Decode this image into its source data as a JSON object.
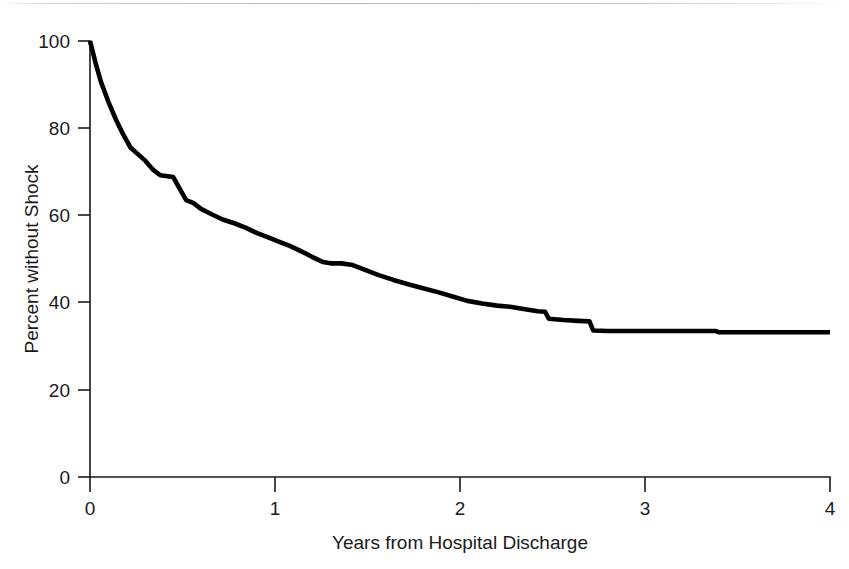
{
  "chart_data": {
    "type": "line",
    "title": "",
    "subtitle": "",
    "xlabel": "Years from Hospital Discharge",
    "ylabel": "Percent without Shock",
    "xlim": [
      0,
      4
    ],
    "ylim": [
      0,
      100
    ],
    "xticks": [
      0,
      1,
      2,
      3,
      4
    ],
    "xtick_labels": [
      "0",
      "1",
      "2",
      "3",
      "4"
    ],
    "yticks": [
      0,
      20,
      40,
      60,
      80,
      100
    ],
    "ytick_labels": [
      "0",
      "20",
      "40",
      "60",
      "80",
      "100"
    ],
    "grid": false,
    "legend": null,
    "legend_position": "none",
    "annotations": [],
    "series": [
      {
        "name": "Percent without Shock",
        "style": "kaplan-meier step-survival curve",
        "color": "#000000",
        "x": [
          0.0,
          0.03,
          0.06,
          0.1,
          0.14,
          0.18,
          0.22,
          0.26,
          0.3,
          0.34,
          0.38,
          0.42,
          0.45,
          0.48,
          0.52,
          0.56,
          0.6,
          0.66,
          0.72,
          0.78,
          0.84,
          0.9,
          0.96,
          1.02,
          1.08,
          1.14,
          1.2,
          1.26,
          1.3,
          1.36,
          1.42,
          1.48,
          1.56,
          1.64,
          1.72,
          1.8,
          1.88,
          1.96,
          2.04,
          2.12,
          2.2,
          2.28,
          2.36,
          2.42,
          2.46,
          2.48,
          2.56,
          2.64,
          2.7,
          2.72,
          2.8,
          2.9,
          3.0,
          3.2,
          3.38,
          3.4,
          3.6,
          3.8,
          4.0
        ],
        "y": [
          100.0,
          95.0,
          90.5,
          86.0,
          82.0,
          78.5,
          75.5,
          74.0,
          72.5,
          70.5,
          69.2,
          69.0,
          68.8,
          66.5,
          63.5,
          62.8,
          61.5,
          60.2,
          59.0,
          58.2,
          57.2,
          56.0,
          55.0,
          54.0,
          53.0,
          51.8,
          50.5,
          49.3,
          49.0,
          49.0,
          48.6,
          47.6,
          46.3,
          45.2,
          44.2,
          43.3,
          42.4,
          41.4,
          40.4,
          39.8,
          39.3,
          39.0,
          38.4,
          38.0,
          37.9,
          36.3,
          36.0,
          35.8,
          35.7,
          33.6,
          33.5,
          33.5,
          33.5,
          33.5,
          33.5,
          33.2,
          33.2,
          33.2,
          33.2
        ]
      }
    ],
    "key_points": [
      {
        "x": 0.0,
        "y": 100.0,
        "note": "start of follow-up at hospital discharge"
      },
      {
        "x": 0.25,
        "y": 74.0,
        "note": "steep early decline"
      },
      {
        "x": 0.4,
        "y": 69.0,
        "note": "short plateau"
      },
      {
        "x": 0.5,
        "y": 63.5,
        "note": "drop after plateau"
      },
      {
        "x": 1.0,
        "y": 54.5,
        "note": "one year"
      },
      {
        "x": 1.33,
        "y": 49.0,
        "note": "plateau near 49 percent"
      },
      {
        "x": 2.0,
        "y": 40.6,
        "note": "two years"
      },
      {
        "x": 2.48,
        "y": 36.3,
        "note": "censoring step down"
      },
      {
        "x": 2.72,
        "y": 33.6,
        "note": "final large step down"
      },
      {
        "x": 3.4,
        "y": 33.2,
        "note": "last small step"
      },
      {
        "x": 4.0,
        "y": 33.2,
        "note": "end of follow-up plateau"
      }
    ]
  },
  "axes": {
    "y_axis_title": "Percent without Shock",
    "x_axis_title": "Years from Hospital Discharge",
    "y_tick_labels": [
      "100",
      "80",
      "60",
      "40",
      "20",
      "0"
    ],
    "x_tick_labels": [
      "0",
      "1",
      "2",
      "3",
      "4"
    ]
  }
}
